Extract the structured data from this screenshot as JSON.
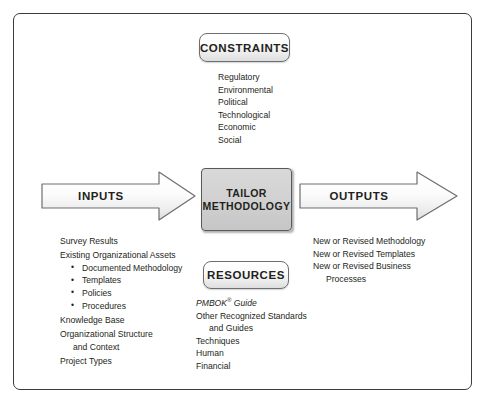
{
  "diagram": {
    "frame_color": "#3b3b40",
    "center": {
      "label_line1": "TAILOR",
      "label_line2": "METHODOLOGY",
      "fill_color": "#d2d2d2"
    },
    "constraints": {
      "title": "CONSTRAINTS",
      "items": [
        "Regulatory",
        "Environmental",
        "Political",
        "Technological",
        "Economic",
        "Social"
      ]
    },
    "resources": {
      "title": "RESOURCES",
      "items": [
        "PMBOK",
        " Guide",
        "Other Recognized Standards",
        "and Guides",
        "Techniques",
        "Human",
        "Financial"
      ]
    },
    "inputs": {
      "title": "INPUTS",
      "items": [
        "Survey Results",
        "Existing Organizational Assets",
        "Documented Methodology",
        "Templates",
        "Policies",
        "Procedures",
        "Knowledge Base",
        "Organizational Structure",
        "and Context",
        "Project Types"
      ]
    },
    "outputs": {
      "title": "OUTPUTS",
      "items": [
        "New or Revised Methodology",
        "New or Revised Templates",
        "New or Revised Business",
        "Processes"
      ]
    }
  }
}
